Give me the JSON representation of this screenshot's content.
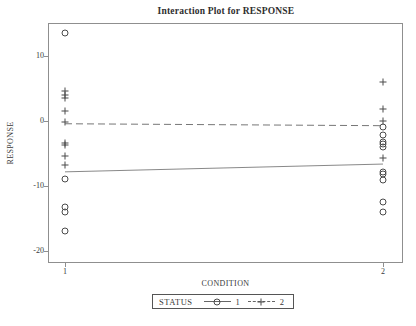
{
  "chart_data": {
    "type": "line",
    "subtype": "interaction-plot-with-scatter",
    "title": "Interaction Plot for RESPONSE",
    "xlabel": "CONDITION",
    "ylabel": "RESPONSE",
    "categories": [
      "1",
      "2"
    ],
    "yticks": [
      10,
      0,
      -10,
      -20
    ],
    "ylim": [
      -22,
      15
    ],
    "grid": false,
    "legend": {
      "title": "STATUS",
      "position": "bottom",
      "entries": [
        {
          "label": "1",
          "marker": "circle",
          "line_style": "solid"
        },
        {
          "label": "2",
          "marker": "plus",
          "line_style": "dashed"
        }
      ]
    },
    "series": [
      {
        "name": "1",
        "marker": "circle",
        "line_style": "solid",
        "line_means": [
          -7.9,
          -6.7
        ],
        "points": {
          "1": [
            13.5,
            -9.0,
            -13.3,
            -14.0,
            -17.0
          ],
          "2": [
            -1.0,
            -2.2,
            -3.3,
            -3.6,
            -4.0,
            -7.9,
            -8.2,
            -9.2,
            -12.5,
            -14.0
          ]
        }
      },
      {
        "name": "2",
        "marker": "plus",
        "line_style": "dashed",
        "line_means": [
          -0.5,
          -0.8
        ],
        "points": {
          "1": [
            4.5,
            4.0,
            3.5,
            1.5,
            -0.2,
            -3.4,
            -3.7,
            -5.5,
            -6.9
          ],
          "2": [
            6.0,
            1.7,
            0.0,
            -5.7
          ]
        }
      }
    ],
    "colors": {
      "frame": "#8f8f8f",
      "solid_line": "#7a7a7a",
      "dashed_line": "#666666",
      "marker": "#4a4a4a",
      "text": "#3a3a3a",
      "background": "#ffffff"
    }
  }
}
